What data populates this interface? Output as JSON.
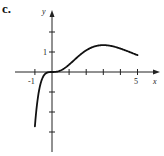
{
  "panel_label": "c.",
  "chart_data": {
    "type": "line",
    "title": "",
    "function_hint": "f(x) = x^3 e^(-x)",
    "xlabel": "x",
    "ylabel": "y",
    "xlim": [
      -1.5,
      6.2
    ],
    "ylim": [
      -3.9,
      3.6
    ],
    "x_ticks": [
      -1,
      0,
      1,
      2,
      3,
      4,
      5
    ],
    "x_tick_labels": {
      "-1": "-1",
      "5": "5"
    },
    "y_ticks": [
      -3,
      -2,
      -1,
      1,
      2
    ],
    "y_tick_labels": {
      "1": "1"
    },
    "grid": false,
    "legend": null,
    "series": [
      {
        "name": "f",
        "x": [
          -1,
          -0.8,
          -0.6,
          -0.4,
          -0.2,
          0,
          0.5,
          1,
          1.5,
          2,
          2.5,
          3,
          3.5,
          4,
          4.5,
          5
        ],
        "y": [
          -2.72,
          -1.14,
          -0.39,
          -0.1,
          -0.01,
          0,
          0.08,
          0.37,
          0.75,
          1.08,
          1.28,
          1.34,
          1.29,
          1.17,
          1.01,
          0.84
        ]
      }
    ]
  },
  "labels": {
    "x_axis": "x",
    "y_axis": "y",
    "tick_neg1": "-1",
    "tick_5": "5",
    "tick_1": "1"
  }
}
